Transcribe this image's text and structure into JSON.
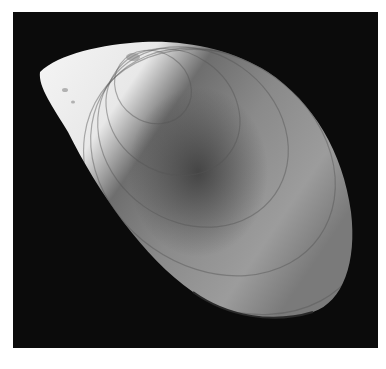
{
  "image": {
    "subject": "mussel shell",
    "style": "grayscale photograph",
    "background_color": "#0b0b0b",
    "border_color": "#ffffff",
    "shell_light_color": "#f2f2f2",
    "shell_mid_color": "#9a9a9a",
    "shell_dark_color": "#4a4a4a"
  }
}
